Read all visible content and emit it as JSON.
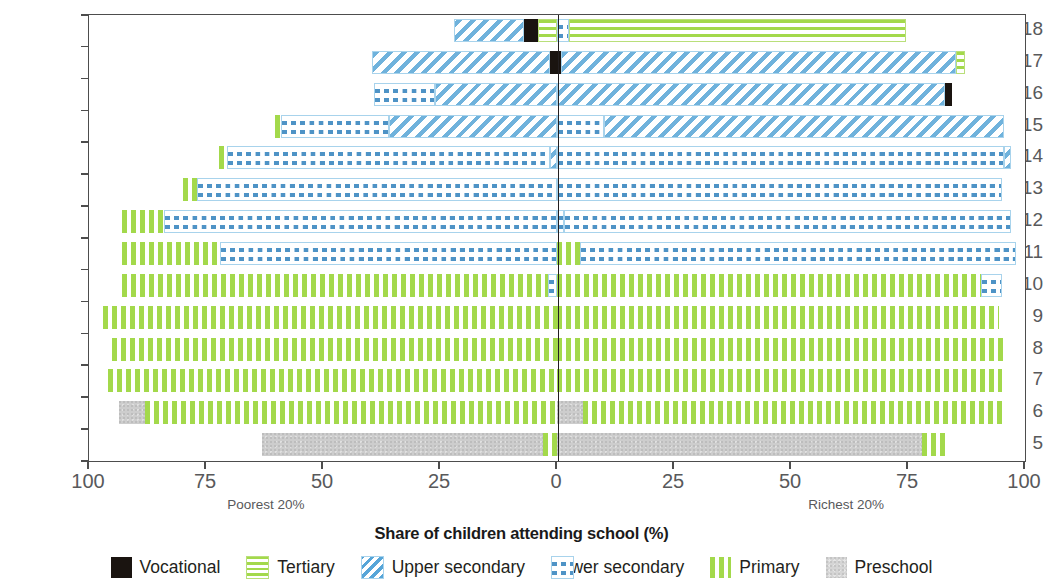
{
  "axes": {
    "y_title": "Age at start of school year",
    "x_title": "Share of children attending school (%)",
    "y_ticks": [
      "18",
      "17",
      "16",
      "15",
      "14",
      "13",
      "12",
      "11",
      "10",
      "9",
      "8",
      "7",
      "6",
      "5"
    ],
    "x_ticks": [
      "100",
      "75",
      "50",
      "25",
      "0",
      "25",
      "50",
      "75",
      "100"
    ],
    "left_group_label": "Poorest 20%",
    "right_group_label": "Richest 20%"
  },
  "legend": {
    "items": [
      {
        "label": "Vocational",
        "key": "vocational",
        "color": "#1a1410",
        "pattern": "solid"
      },
      {
        "label": "Tertiary",
        "key": "tertiary",
        "color": "#a3d94b",
        "pattern": "horizontal-lines"
      },
      {
        "label": "Upper secondary",
        "key": "upper",
        "color": "#6fb2dc",
        "pattern": "diagonal-hatch"
      },
      {
        "label": "Lower secondary",
        "key": "lower",
        "color": "#4e93c6",
        "pattern": "checker"
      },
      {
        "label": "Primary",
        "key": "primary",
        "color": "#a3d94b",
        "pattern": "vertical-lines"
      },
      {
        "label": "Preschool",
        "key": "preschool",
        "color": "#cdcdcd",
        "pattern": "speckle"
      }
    ]
  },
  "chart_data": {
    "type": "bar",
    "orientation": "horizontal-diverging",
    "title": "",
    "xlabel": "Share of children attending school (%)",
    "ylabel": "Age at start of school year",
    "xlim": [
      -100,
      100
    ],
    "x_tick_values": [
      -100,
      -75,
      -50,
      -25,
      0,
      25,
      50,
      75,
      100
    ],
    "x_tick_labels": [
      "100",
      "75",
      "50",
      "25",
      "0",
      "25",
      "50",
      "75",
      "100"
    ],
    "grid": false,
    "legend_position": "bottom",
    "categories": [
      "18",
      "17",
      "16",
      "15",
      "14",
      "13",
      "12",
      "11",
      "10",
      "9",
      "8",
      "7",
      "6",
      "5"
    ],
    "series_keys": [
      "vocational",
      "tertiary",
      "upper",
      "lower",
      "primary",
      "preschool"
    ],
    "note": "Each row is a stacked bar: the left half shows the poorest 20% of children, the right half shows the richest 20%. Values are percent of children attending school at each education level.",
    "rows": [
      {
        "age": "18",
        "poorest": [
          {
            "level": "tertiary",
            "value": 4.0
          },
          {
            "level": "vocational",
            "value": 3.0
          },
          {
            "level": "upper",
            "value": 15.0
          }
        ],
        "richest": [
          {
            "level": "lower",
            "value": 2.5
          },
          {
            "level": "tertiary",
            "value": 72.0
          }
        ]
      },
      {
        "age": "17",
        "poorest": [
          {
            "level": "vocational",
            "value": 1.5
          },
          {
            "level": "upper",
            "value": 38.0
          }
        ],
        "richest": [
          {
            "level": "vocational",
            "value": 0.8
          },
          {
            "level": "upper",
            "value": 84.5
          },
          {
            "level": "tertiary",
            "value": 1.8
          }
        ]
      },
      {
        "age": "16",
        "poorest": [
          {
            "level": "upper",
            "value": 26.0
          },
          {
            "level": "lower",
            "value": 13.0
          }
        ],
        "richest": [
          {
            "level": "upper",
            "value": 83.0
          },
          {
            "level": "vocational",
            "value": 1.5
          }
        ]
      },
      {
        "age": "15",
        "poorest": [
          {
            "level": "upper",
            "value": 36.0
          },
          {
            "level": "lower",
            "value": 23.0
          },
          {
            "level": "primary",
            "value": 1.3
          }
        ],
        "richest": [
          {
            "level": "lower",
            "value": 10.0
          },
          {
            "level": "upper",
            "value": 85.5
          }
        ]
      },
      {
        "age": "14",
        "poorest": [
          {
            "level": "upper",
            "value": 1.5
          },
          {
            "level": "lower",
            "value": 69.0
          },
          {
            "level": "primary",
            "value": 1.8
          }
        ],
        "richest": [
          {
            "level": "lower",
            "value": 95.5
          },
          {
            "level": "upper",
            "value": 1.5
          }
        ]
      },
      {
        "age": "13",
        "poorest": [
          {
            "level": "lower",
            "value": 77.0
          },
          {
            "level": "primary",
            "value": 3.0
          }
        ],
        "richest": [
          {
            "level": "lower",
            "value": 95.0
          }
        ]
      },
      {
        "age": "12",
        "poorest": [
          {
            "level": "lower",
            "value": 84.0
          },
          {
            "level": "primary",
            "value": 9.0
          }
        ],
        "richest": [
          {
            "level": "lower",
            "value": 1.5
          },
          {
            "level": "lower",
            "value": 95.5
          }
        ]
      },
      {
        "age": "11",
        "poorest": [
          {
            "level": "lower",
            "value": 72.0
          },
          {
            "level": "primary",
            "value": 21.0
          }
        ],
        "richest": [
          {
            "level": "primary",
            "value": 5.0
          },
          {
            "level": "lower",
            "value": 93.0
          }
        ]
      },
      {
        "age": "10",
        "poorest": [
          {
            "level": "lower",
            "value": 2.0
          },
          {
            "level": "primary",
            "value": 91.0
          }
        ],
        "richest": [
          {
            "level": "primary",
            "value": 90.5
          },
          {
            "level": "lower",
            "value": 4.5
          }
        ]
      },
      {
        "age": "9",
        "poorest": [
          {
            "level": "primary",
            "value": 97.0
          }
        ],
        "richest": [
          {
            "level": "primary",
            "value": 94.5
          }
        ]
      },
      {
        "age": "8",
        "poorest": [
          {
            "level": "primary",
            "value": 95.0
          }
        ],
        "richest": [
          {
            "level": "primary",
            "value": 96.0
          }
        ]
      },
      {
        "age": "7",
        "poorest": [
          {
            "level": "primary",
            "value": 96.0
          }
        ],
        "richest": [
          {
            "level": "primary",
            "value": 95.0
          }
        ]
      },
      {
        "age": "6",
        "poorest": [
          {
            "level": "primary",
            "value": 88.0
          },
          {
            "level": "preschool",
            "value": 5.5
          }
        ],
        "richest": [
          {
            "level": "preschool",
            "value": 5.5
          },
          {
            "level": "primary",
            "value": 90.5
          }
        ]
      },
      {
        "age": "5",
        "poorest": [
          {
            "level": "primary",
            "value": 3.0
          },
          {
            "level": "preschool",
            "value": 60.0
          }
        ],
        "richest": [
          {
            "level": "preschool",
            "value": 78.0
          },
          {
            "level": "primary",
            "value": 5.0
          }
        ]
      }
    ]
  }
}
